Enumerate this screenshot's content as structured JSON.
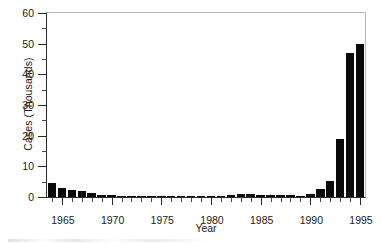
{
  "chart_data": {
    "type": "bar",
    "title": "",
    "subtitle": "",
    "xlabel": "Year",
    "ylabel": "Cases (Thousands)",
    "xlim": [
      1963.5,
      1995.5
    ],
    "ylim": [
      0,
      60
    ],
    "ytick_values": [
      0,
      10,
      20,
      30,
      40,
      50,
      60
    ],
    "ytick_labels": [
      "0",
      "10",
      "20",
      "30",
      "40",
      "50",
      "60"
    ],
    "ytick_minor_values": [
      5,
      15,
      25,
      35,
      45,
      55
    ],
    "xtick_values": [
      1965,
      1970,
      1975,
      1980,
      1985,
      1990,
      1995
    ],
    "xtick_labels": [
      "1965",
      "1970",
      "1975",
      "1980",
      "1985",
      "1990",
      "1995"
    ],
    "grid": false,
    "legend": null,
    "bar_color": "#0a0a0a",
    "axis_color": "#2a2a2a",
    "categories": [
      1964,
      1965,
      1966,
      1967,
      1968,
      1969,
      1970,
      1971,
      1972,
      1973,
      1974,
      1975,
      1976,
      1977,
      1978,
      1979,
      1980,
      1981,
      1982,
      1983,
      1984,
      1985,
      1986,
      1987,
      1988,
      1989,
      1990,
      1991,
      1992,
      1993,
      1994,
      1995
    ],
    "values": [
      4.6,
      3.1,
      2.2,
      2.1,
      1.4,
      0.7,
      0.5,
      0.3,
      0.2,
      0.15,
      0.12,
      0.1,
      0.1,
      0.15,
      0.2,
      0.2,
      0.2,
      0.25,
      0.6,
      0.9,
      1.0,
      0.8,
      0.7,
      0.6,
      0.5,
      0.3,
      1.0,
      2.6,
      5.2,
      19.0,
      47.0,
      50.0
    ],
    "series_name": "Cases",
    "annotations": []
  },
  "axis": {
    "y_title": "Cases (Thousands)",
    "x_title": "Year"
  }
}
